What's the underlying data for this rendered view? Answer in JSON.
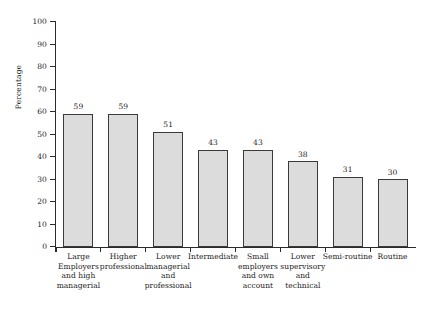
{
  "chart_data": {
    "type": "bar",
    "title": "",
    "xlabel": "",
    "ylabel": "Percentage",
    "ylim": [
      0,
      100
    ],
    "ytick_step": 10,
    "yticks": [
      0,
      10,
      20,
      30,
      40,
      50,
      60,
      70,
      80,
      90,
      100
    ],
    "ytick_labels": [
      "0",
      "10",
      "20",
      "30",
      "40",
      "50",
      "60",
      "70",
      "80",
      "90",
      "100"
    ],
    "grid": false,
    "legend": "none",
    "bar_fill_color": "#dcdcdc",
    "bar_edge_color": "#3a3a3a",
    "background_color": "#ffffff",
    "categories": [
      "Large Employers and high managerial",
      "Higher professional",
      "Lower managerial and professional",
      "Intermediate",
      "Small employers and own account",
      "Lower supervisory and technical",
      "Semi-routine",
      "Routine"
    ],
    "category_lines": [
      [
        "Large",
        "Employers",
        "and high",
        "managerial"
      ],
      [
        "Higher",
        "professional"
      ],
      [
        "Lower",
        "managerial",
        "and",
        "professional"
      ],
      [
        "Intermediate"
      ],
      [
        "Small",
        "employers",
        "and own",
        "account"
      ],
      [
        "Lower",
        "supervisory",
        "and",
        "technical"
      ],
      [
        "Semi-routine"
      ],
      [
        "Routine"
      ]
    ],
    "values": [
      59,
      59,
      51,
      43,
      43,
      38,
      31,
      30
    ],
    "value_labels": [
      "59",
      "59",
      "51",
      "43",
      "43",
      "38",
      "31",
      "30"
    ]
  }
}
